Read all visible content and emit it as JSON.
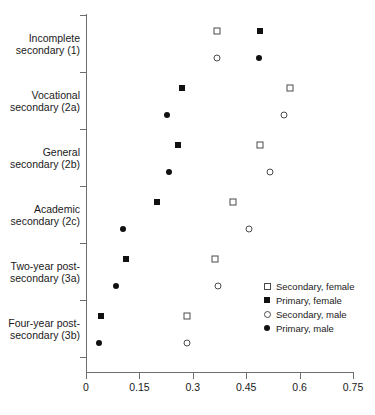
{
  "chart_data": {
    "type": "scatter",
    "title": "",
    "subtitle": "",
    "xlabel": "",
    "ylabel": "",
    "xlim": [
      0,
      0.75
    ],
    "xticks": [
      "0",
      "0.15",
      "0.3",
      "0.45",
      "0.6",
      "0.75"
    ],
    "xtick_values": [
      0,
      0.15,
      0.3,
      0.45,
      0.6,
      0.75
    ],
    "grid": false,
    "legend_position": "center-right",
    "categories": [
      "Incomplete\nsecondary (1)",
      "Vocational\nsecondary (2a)",
      "General\nsecondary (2b)",
      "Academic\nsecondary (2c)",
      "Two-year post-\nsecondary (3a)",
      "Four-year post-\nsecondary (3b)"
    ],
    "series": [
      {
        "name": "Secondary, female",
        "marker": "open-square",
        "values": [
          0.368,
          0.573,
          0.49,
          0.413,
          0.362,
          0.284
        ]
      },
      {
        "name": "Primary, female",
        "marker": "filled-square",
        "values": [
          0.49,
          0.27,
          0.258,
          0.2,
          0.113,
          0.042
        ]
      },
      {
        "name": "Secondary, male",
        "marker": "open-circle",
        "values": [
          0.368,
          0.556,
          0.516,
          0.458,
          0.371,
          0.284
        ]
      },
      {
        "name": "Primary, male",
        "marker": "filled-circle",
        "values": [
          0.486,
          0.228,
          0.233,
          0.104,
          0.084,
          0.037
        ]
      }
    ]
  },
  "legend": {
    "entries": [
      {
        "label": "Secondary, female",
        "marker": "open-square"
      },
      {
        "label": "Primary, female",
        "marker": "filled-square"
      },
      {
        "label": "Secondary, male",
        "marker": "open-circle"
      },
      {
        "label": "Primary, male",
        "marker": "filled-circle"
      }
    ]
  },
  "colors": {
    "filled": "#111111",
    "open_stroke": "#4a4a4a",
    "axis": "#6e6e6e",
    "text": "#1a1a1a",
    "background": "#ffffff"
  }
}
